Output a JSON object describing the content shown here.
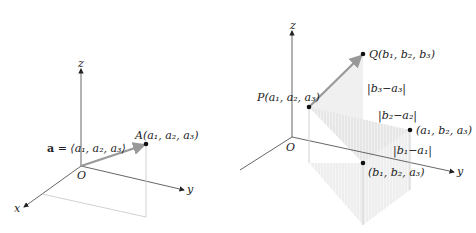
{
  "colors": {
    "axis": "#555555",
    "vector": "#9a9a9a",
    "guide": "#bdbdbd",
    "shade": "#e3e3e3",
    "point": "#111111"
  },
  "left_figure": {
    "axes": {
      "z": "z",
      "y": "y",
      "x": "x",
      "origin": "O"
    },
    "vector_label_bold": "a",
    "vector_label_rest": " = ⟨a₁, a₂, a₃⟩",
    "point_label": "A(a₁, a₂, a₃)"
  },
  "right_figure": {
    "axes": {
      "z": "z",
      "y": "y",
      "x": "x",
      "origin": "O"
    },
    "P_label": "P(a₁, a₂, a₃)",
    "Q_label": "Q(b₁, b₂, b₃)",
    "diff3_label": "|b₃−a₃|",
    "diff2_label": "|b₂−a₂|",
    "diff1_label": "|b₁−a₁|",
    "mid_point_label": "(a₁, b₂, a₃)",
    "foot_point_label": "(b₁, b₂, a₃)"
  }
}
